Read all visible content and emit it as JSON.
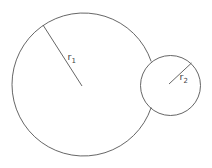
{
  "diagram": {
    "type": "tangent-circles",
    "stroke_color": "#555555",
    "label_color": "#444444",
    "large_circle": {
      "label_main": "r",
      "label_sub": "1",
      "center": [
        83.5,
        84.5
      ],
      "radius": 71.5
    },
    "small_circle": {
      "label_main": "r",
      "label_sub": "2",
      "center": [
        170.5,
        85.5
      ],
      "radius": 30
    }
  }
}
